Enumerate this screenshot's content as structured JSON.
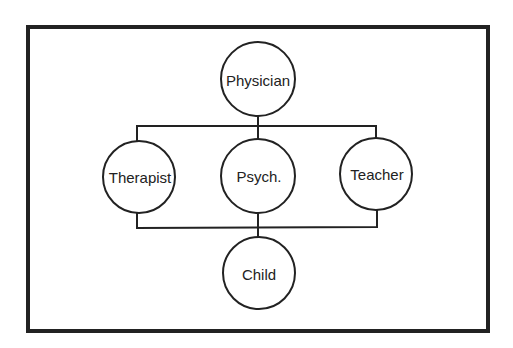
{
  "diagram": {
    "type": "hierarchy",
    "colors": {
      "stroke": "#222222",
      "background": "#ffffff",
      "text": "#222222"
    },
    "frame": {
      "x": 28,
      "y": 27,
      "width": 460,
      "height": 304
    },
    "nodes": [
      {
        "id": "physician",
        "label": "Physician",
        "cx": 258,
        "cy": 79,
        "r": 37
      },
      {
        "id": "therapist",
        "label": "Therapist",
        "cx": 139,
        "cy": 177,
        "r": 36
      },
      {
        "id": "psych",
        "label": "Psych.",
        "cx": 258,
        "cy": 176,
        "r": 37
      },
      {
        "id": "teacher",
        "label": "Teacher",
        "cx": 376,
        "cy": 174,
        "r": 36
      },
      {
        "id": "child",
        "label": "Child",
        "cx": 259,
        "cy": 273,
        "r": 36
      }
    ],
    "edges": [
      {
        "from": "physician",
        "to": "therapist"
      },
      {
        "from": "physician",
        "to": "psych"
      },
      {
        "from": "physician",
        "to": "teacher"
      },
      {
        "from": "therapist",
        "to": "child"
      },
      {
        "from": "psych",
        "to": "child"
      },
      {
        "from": "teacher",
        "to": "child"
      }
    ]
  }
}
